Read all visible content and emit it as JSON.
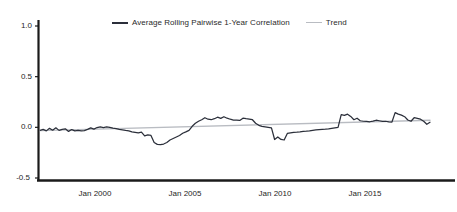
{
  "chart_data": {
    "type": "line",
    "title": "",
    "subtitle": "",
    "xlabel": "",
    "ylabel": "",
    "ylim": [
      -0.5,
      1.0
    ],
    "yticks": [
      1.0,
      0.5,
      0.0,
      -0.5
    ],
    "ytick_labels": [
      "1.0",
      "0.5",
      "0.0",
      "-0.5"
    ],
    "xlim": [
      "Jan 1997",
      "Jan 2018"
    ],
    "xticks": [
      "Jan 2000",
      "Jan 2005",
      "Jan 2010",
      "Jan 2015"
    ],
    "xtick_labels": [
      "Jan 2000",
      "Jan 2005",
      "Jan 2010",
      "Jan 2015"
    ],
    "grid": false,
    "legend_position": "top-center",
    "legend": [
      {
        "name": "Average Rolling Pairwise 1-Year Correlation",
        "color": "#2b2f3a",
        "marker": "line"
      },
      {
        "name": "Trend",
        "color": "#b9bcc2",
        "marker": "line"
      }
    ],
    "series": [
      {
        "name": "Average Rolling Pairwise 1-Year Correlation",
        "color": "#2b2f3a",
        "x": [
          "1997-06",
          "1997-09",
          "1997-12",
          "1998-02",
          "1998-04",
          "1998-06",
          "1998-08",
          "1998-10",
          "1998-12",
          "1999-02",
          "1999-04",
          "1999-06",
          "1999-08",
          "1999-10",
          "1999-12",
          "2000-02",
          "2000-04",
          "2000-06",
          "2000-08",
          "2000-10",
          "2000-12",
          "2001-02",
          "2001-04",
          "2001-06",
          "2001-08",
          "2001-10",
          "2001-12",
          "2002-02",
          "2002-04",
          "2002-06",
          "2002-08",
          "2002-10",
          "2002-12",
          "2003-02",
          "2003-04",
          "2003-06",
          "2003-08",
          "2003-10",
          "2003-12",
          "2004-02",
          "2004-04",
          "2004-06",
          "2004-08",
          "2004-10",
          "2004-12",
          "2005-02",
          "2005-04",
          "2005-06",
          "2005-08",
          "2005-10",
          "2005-12",
          "2006-02",
          "2006-04",
          "2006-06",
          "2006-08",
          "2006-10",
          "2006-12",
          "2007-02",
          "2007-04",
          "2007-06",
          "2007-08",
          "2007-10",
          "2007-12",
          "2008-02",
          "2008-04",
          "2008-06",
          "2008-08",
          "2008-10",
          "2008-12",
          "2009-02",
          "2009-04",
          "2009-06",
          "2009-08",
          "2009-10",
          "2009-12",
          "2010-02",
          "2010-04",
          "2010-06",
          "2010-08",
          "2010-10",
          "2010-12",
          "2011-02",
          "2011-04",
          "2011-06",
          "2011-08",
          "2011-10",
          "2011-12",
          "2012-02",
          "2012-04",
          "2012-06",
          "2012-08",
          "2012-10",
          "2012-12",
          "2013-02",
          "2013-04",
          "2013-06",
          "2013-08",
          "2013-10",
          "2013-12",
          "2014-02",
          "2014-04",
          "2014-06",
          "2014-08",
          "2014-10",
          "2014-12",
          "2015-02",
          "2015-04",
          "2015-06",
          "2015-08",
          "2015-10",
          "2015-12",
          "2016-02",
          "2016-04",
          "2016-06",
          "2016-08",
          "2016-10",
          "2016-12",
          "2017-02",
          "2017-04",
          "2017-06",
          "2017-08",
          "2017-10",
          "2017-12",
          "2018-02"
        ],
        "values": [
          -0.03,
          -0.02,
          -0.035,
          -0.01,
          -0.028,
          -0.005,
          -0.03,
          -0.02,
          -0.015,
          -0.04,
          -0.022,
          -0.035,
          -0.03,
          -0.035,
          -0.032,
          -0.02,
          -0.005,
          -0.018,
          -0.002,
          0.005,
          -0.002,
          0.004,
          0.0,
          -0.008,
          -0.012,
          -0.02,
          -0.024,
          -0.03,
          -0.035,
          -0.045,
          -0.05,
          -0.055,
          -0.048,
          -0.085,
          -0.075,
          -0.08,
          -0.15,
          -0.168,
          -0.17,
          -0.165,
          -0.15,
          -0.125,
          -0.11,
          -0.095,
          -0.08,
          -0.058,
          -0.045,
          -0.03,
          0.01,
          0.04,
          0.06,
          0.075,
          0.095,
          0.08,
          0.075,
          0.085,
          0.1,
          0.088,
          0.105,
          0.09,
          0.08,
          0.072,
          0.07,
          0.068,
          0.09,
          0.085,
          0.082,
          0.075,
          0.04,
          0.02,
          0.01,
          0.005,
          0.0,
          -0.005,
          -0.12,
          -0.095,
          -0.12,
          -0.125,
          -0.06,
          -0.055,
          -0.05,
          -0.048,
          -0.045,
          -0.04,
          -0.038,
          -0.035,
          -0.03,
          -0.025,
          -0.022,
          -0.02,
          -0.018,
          -0.015,
          -0.01,
          -0.005,
          0.0,
          0.125,
          0.118,
          0.13,
          0.108,
          0.075,
          0.09,
          0.065,
          0.06,
          0.058,
          0.055,
          0.062,
          0.07,
          0.065,
          0.058,
          0.06,
          0.055,
          0.052,
          0.145,
          0.13,
          0.12,
          0.105,
          0.072,
          0.06,
          0.095,
          0.088,
          0.08,
          0.06,
          0.03,
          0.05
        ]
      },
      {
        "name": "Trend",
        "color": "#b9bcc2",
        "x": [
          "1997-06",
          "2018-02"
        ],
        "values": [
          -0.032,
          0.07
        ]
      }
    ]
  },
  "axes": {
    "y_tick_labels": [
      "1.0",
      "0.5",
      "0.0",
      "-0.5"
    ],
    "x_tick_labels": [
      "Jan 2000",
      "Jan 2005",
      "Jan 2010",
      "Jan 2015"
    ]
  },
  "legend": {
    "series_label": "Average Rolling Pairwise 1-Year Correlation",
    "trend_label": "Trend"
  },
  "colors": {
    "series": "#2b2f3a",
    "trend": "#b9bcc2",
    "axis": "#1a1a1a",
    "background": "#ffffff",
    "tick_text": "#262626"
  }
}
